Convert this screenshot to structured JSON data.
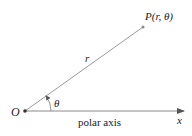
{
  "diagram": {
    "type": "polar-coordinate-diagram",
    "origin": {
      "label": "O",
      "x": 25,
      "y": 111
    },
    "point": {
      "label": "P(r, θ)",
      "x": 143,
      "y": 27
    },
    "radius_label": "r",
    "angle_label": "θ",
    "axis_label": "polar axis",
    "axis_end_label": "x",
    "colors": {
      "line": "#8a8a8a",
      "text": "#222222",
      "point": "#555555"
    }
  }
}
